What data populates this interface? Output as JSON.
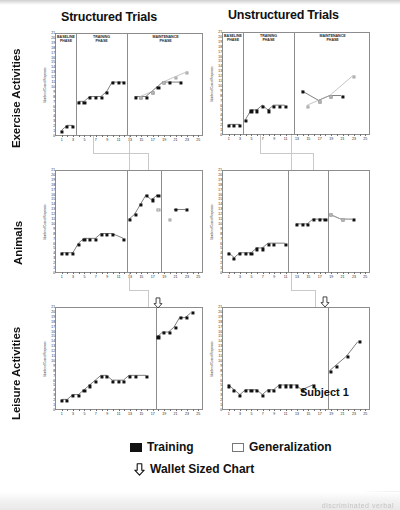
{
  "figure": {
    "columns": [
      {
        "title": "Structured Trials"
      },
      {
        "title": "Unstructured Trials"
      }
    ],
    "rows": [
      {
        "label": "Exercise Activities"
      },
      {
        "label": "Animals"
      },
      {
        "label": "Leisure Activities"
      }
    ],
    "subject_label": "Subject 1",
    "phases": [
      {
        "name": "BASELINE",
        "line2": "PHASE"
      },
      {
        "name": "TRAINING",
        "line2": "PHASE"
      },
      {
        "name": "MAINTENANCE",
        "line2": "PHASE"
      }
    ],
    "y_axis_title": "Number of Correct Responses",
    "scan_artifact_text": "discriminated verbal"
  },
  "legend": {
    "training_label": "Training",
    "generalization_label": "Generalization",
    "wallet_label": "Wallet Sized Chart",
    "training_icon": "filled-square-icon",
    "generalization_icon": "open-square-icon",
    "wallet_icon": "down-arrow-icon"
  },
  "colors": {
    "training": "#111111",
    "generalization": "#ffffff",
    "generalization_edge": "#9a9a9a",
    "frame": "#8d8d8d",
    "connector": "#c9c9c9"
  },
  "chart_data": [
    {
      "id": "exercise-structured",
      "type": "line",
      "title": "Structured Trials",
      "row": "Exercise Activities",
      "xlabel": "Sessions",
      "ylabel": "Number of Correct Responses",
      "xlim": [
        0,
        26
      ],
      "ylim": [
        0,
        21
      ],
      "xticks": [
        1,
        3,
        5,
        7,
        9,
        11,
        13,
        15,
        17,
        19,
        21,
        23,
        25
      ],
      "yticks": [
        0,
        1,
        2,
        3,
        4,
        5,
        6,
        7,
        8,
        9,
        10,
        11,
        12,
        13,
        14,
        15,
        16,
        17,
        18,
        19,
        20,
        21
      ],
      "grid": false,
      "legend_position": "below-figure",
      "phase_dividers": [
        3.5,
        12.5
      ],
      "phase_labels": [
        "BASELINE PHASE",
        "TRAINING PHASE",
        "MAINTENANCE PHASE"
      ],
      "series": [
        {
          "name": "Training",
          "x": [
            1,
            2,
            3,
            4,
            5,
            6,
            7,
            8,
            9,
            10,
            11,
            12,
            14,
            15,
            16,
            17,
            18,
            19,
            20,
            22
          ],
          "values": [
            1,
            2,
            2,
            7,
            7,
            8,
            8,
            8,
            9,
            11,
            11,
            11,
            8,
            8,
            8,
            9,
            10,
            11,
            11,
            11
          ]
        },
        {
          "name": "Generalization",
          "x": [
            15,
            17,
            19,
            21,
            23
          ],
          "values": [
            8,
            9,
            11,
            12,
            13
          ]
        }
      ]
    },
    {
      "id": "exercise-unstructured",
      "type": "line",
      "title": "Unstructured Trials",
      "row": "Exercise Activities",
      "xlabel": "Sessions",
      "ylabel": "Number of Correct Responses",
      "xlim": [
        0,
        26
      ],
      "ylim": [
        0,
        21
      ],
      "xticks": [
        1,
        3,
        5,
        7,
        9,
        11,
        13,
        15,
        17,
        19,
        21,
        23,
        25
      ],
      "yticks": [
        0,
        1,
        2,
        3,
        4,
        5,
        6,
        7,
        8,
        9,
        10,
        11,
        12,
        13,
        14,
        15,
        16,
        17,
        18,
        19,
        20,
        21
      ],
      "grid": false,
      "legend_position": "below-figure",
      "phase_dividers": [
        3.5,
        12.5
      ],
      "phase_labels": [
        "BASELINE PHASE",
        "TRAINING PHASE",
        "MAINTENANCE PHASE"
      ],
      "series": [
        {
          "name": "Training",
          "x": [
            1,
            2,
            3,
            4,
            5,
            6,
            7,
            8,
            9,
            10,
            11,
            14,
            17,
            19,
            21
          ],
          "values": [
            2,
            2,
            2,
            3,
            5,
            5,
            6,
            5,
            6,
            6,
            6,
            9,
            7,
            8,
            8
          ]
        },
        {
          "name": "Generalization",
          "x": [
            15,
            17,
            19,
            23
          ],
          "values": [
            6,
            7,
            8,
            12
          ]
        }
      ]
    },
    {
      "id": "animals-structured",
      "type": "line",
      "title": "Structured Trials",
      "row": "Animals",
      "xlabel": "Sessions",
      "ylabel": "Number of Correct Responses",
      "xlim": [
        0,
        26
      ],
      "ylim": [
        0,
        21
      ],
      "xticks": [
        1,
        3,
        5,
        7,
        9,
        11,
        13,
        15,
        17,
        19,
        21,
        23,
        25
      ],
      "yticks": [
        0,
        1,
        2,
        3,
        4,
        5,
        6,
        7,
        8,
        9,
        10,
        11,
        12,
        13,
        14,
        15,
        16,
        17,
        18,
        19,
        20,
        21
      ],
      "grid": false,
      "legend_position": "below-figure",
      "phase_dividers": [
        12.5,
        18.5
      ],
      "phase_labels": [
        "",
        "",
        ""
      ],
      "series": [
        {
          "name": "Training",
          "x": [
            1,
            2,
            3,
            4,
            5,
            6,
            7,
            8,
            9,
            10,
            12,
            13,
            14,
            15,
            16,
            17,
            18,
            21,
            23
          ],
          "values": [
            4,
            4,
            4,
            6,
            7,
            7,
            7,
            8,
            8,
            8,
            7,
            11,
            12,
            14,
            16,
            15,
            16,
            13,
            13
          ]
        },
        {
          "name": "Generalization",
          "x": [
            18,
            20
          ],
          "values": [
            13,
            11
          ]
        }
      ]
    },
    {
      "id": "animals-unstructured",
      "type": "line",
      "title": "Unstructured Trials",
      "row": "Animals",
      "xlabel": "Sessions",
      "ylabel": "Number of Correct Responses",
      "xlim": [
        0,
        26
      ],
      "ylim": [
        0,
        21
      ],
      "xticks": [
        1,
        3,
        5,
        7,
        9,
        11,
        13,
        15,
        17,
        19,
        21,
        23,
        25
      ],
      "yticks": [
        0,
        1,
        2,
        3,
        4,
        5,
        6,
        7,
        8,
        9,
        10,
        11,
        12,
        13,
        14,
        15,
        16,
        17,
        18,
        19,
        20,
        21
      ],
      "grid": false,
      "legend_position": "below-figure",
      "phase_dividers": [
        11.5,
        18.5
      ],
      "phase_labels": [
        "",
        "",
        ""
      ],
      "series": [
        {
          "name": "Training",
          "x": [
            1,
            2,
            3,
            4,
            5,
            6,
            7,
            8,
            9,
            11,
            13,
            14,
            15,
            16,
            17,
            18,
            19,
            21,
            23
          ],
          "values": [
            4,
            3,
            4,
            4,
            4,
            5,
            5,
            6,
            6,
            6,
            10,
            10,
            10,
            11,
            11,
            11,
            12,
            11,
            11
          ]
        },
        {
          "name": "Generalization",
          "x": [
            19,
            21
          ],
          "values": [
            12,
            11
          ]
        }
      ]
    },
    {
      "id": "leisure-structured",
      "type": "line",
      "title": "Structured Trials",
      "row": "Leisure Activities",
      "xlabel": "Sessions",
      "ylabel": "Number of Correct Responses",
      "xlim": [
        0,
        26
      ],
      "ylim": [
        0,
        21
      ],
      "xticks": [
        1,
        3,
        5,
        7,
        9,
        11,
        13,
        15,
        17,
        19,
        21,
        23,
        25
      ],
      "yticks": [
        0,
        1,
        2,
        3,
        4,
        5,
        6,
        7,
        8,
        9,
        10,
        11,
        12,
        13,
        14,
        15,
        16,
        17,
        18,
        19,
        20,
        21
      ],
      "grid": false,
      "legend_position": "below-figure",
      "phase_dividers": [
        17.5
      ],
      "phase_labels": [
        "",
        ""
      ],
      "series": [
        {
          "name": "Training",
          "x": [
            1,
            2,
            3,
            4,
            5,
            6,
            7,
            8,
            9,
            10,
            11,
            12,
            13,
            14,
            16,
            18,
            19,
            20,
            21,
            22,
            23,
            24
          ],
          "values": [
            2,
            2,
            3,
            3,
            4,
            5,
            6,
            7,
            7,
            6,
            6,
            6,
            7,
            7,
            7,
            15,
            16,
            16,
            17,
            19,
            19,
            20
          ]
        }
      ]
    },
    {
      "id": "leisure-unstructured",
      "type": "line",
      "title": "Unstructured Trials",
      "row": "Leisure Activities",
      "xlabel": "Sessions",
      "ylabel": "Number of Correct Responses",
      "xlim": [
        0,
        26
      ],
      "ylim": [
        0,
        21
      ],
      "xticks": [
        1,
        3,
        5,
        7,
        9,
        11,
        13,
        15,
        17,
        19,
        21,
        23,
        25
      ],
      "yticks": [
        0,
        1,
        2,
        3,
        4,
        5,
        6,
        7,
        8,
        9,
        10,
        11,
        12,
        13,
        14,
        15,
        16,
        17,
        18,
        19,
        20,
        21
      ],
      "grid": false,
      "legend_position": "below-figure",
      "phase_dividers": [
        18.5
      ],
      "phase_labels": [
        "",
        ""
      ],
      "series": [
        {
          "name": "Training",
          "x": [
            1,
            2,
            3,
            4,
            5,
            6,
            7,
            8,
            9,
            10,
            11,
            12,
            13,
            14,
            16,
            19,
            20,
            22,
            24
          ],
          "values": [
            5,
            4,
            3,
            4,
            4,
            4,
            3,
            4,
            4,
            5,
            5,
            5,
            5,
            4,
            5,
            8,
            9,
            11,
            14
          ]
        }
      ]
    }
  ]
}
